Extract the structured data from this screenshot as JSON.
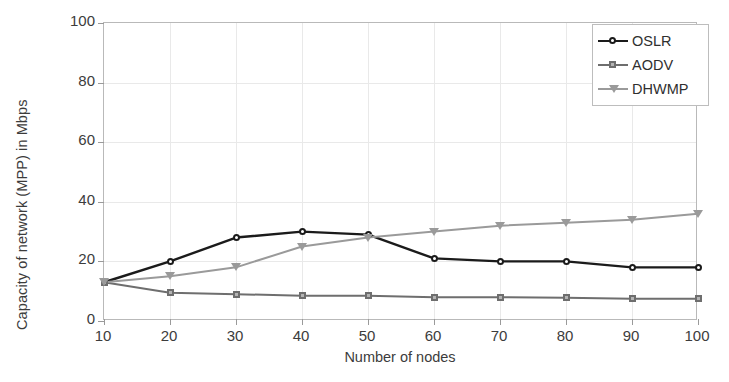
{
  "chart_data": {
    "type": "line",
    "title": "",
    "xlabel": "Number of nodes",
    "ylabel": "Capacity of network (MPP) in Mbps",
    "x": [
      10,
      20,
      30,
      40,
      50,
      60,
      70,
      80,
      90,
      100
    ],
    "xticks": [
      "10",
      "20",
      "30",
      "40",
      "50",
      "60",
      "70",
      "80",
      "90",
      "100"
    ],
    "yticks": [
      "0",
      "20",
      "40",
      "60",
      "80",
      "100"
    ],
    "xlim": [
      10,
      100
    ],
    "ylim": [
      0,
      100
    ],
    "grid": true,
    "legend_position": "top-right",
    "series": [
      {
        "name": "OSLR",
        "color": "#1b1b1b",
        "marker": "circle-marker",
        "values": [
          13,
          20,
          28,
          30,
          29,
          21,
          20,
          20,
          18,
          18
        ]
      },
      {
        "name": "AODV",
        "color": "#6e6e6e",
        "marker": "square-marker",
        "values": [
          13,
          9.5,
          9,
          8.5,
          8.5,
          8,
          8,
          7.8,
          7.5,
          7.5
        ]
      },
      {
        "name": "DHWMP",
        "color": "#9a9a9a",
        "marker": "triangle-down-marker",
        "values": [
          13,
          15,
          18,
          25,
          28,
          30,
          32,
          33,
          34,
          36
        ]
      }
    ]
  },
  "legend": {
    "entries": [
      {
        "label": "OSLR"
      },
      {
        "label": "AODV"
      },
      {
        "label": "DHWMP"
      }
    ]
  },
  "axes": {
    "x_title": "Number of nodes",
    "y_title": "Capacity of network (MPP) in Mbps"
  },
  "colors": {
    "oslr": "#1b1b1b",
    "aodv": "#6e6e6e",
    "dhwmp": "#9a9a9a",
    "grid": "#e9e9e9",
    "frame": "#b9b9b9",
    "text": "#3c3c3c"
  }
}
